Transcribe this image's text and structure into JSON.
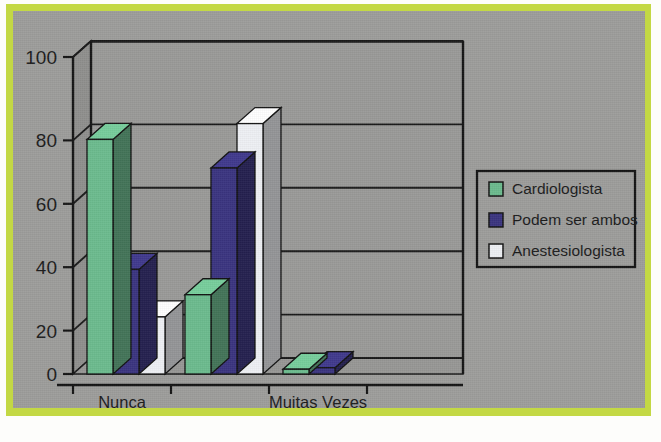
{
  "figure": {
    "border_color": "#c3d844",
    "plate_color": "#9d9d9b"
  },
  "chart_data": {
    "type": "bar",
    "title": "",
    "subtitle": "",
    "xlabel": "",
    "ylabel": "",
    "categories": [
      "Nunca",
      "",
      "Muitas Vezes",
      ""
    ],
    "visible_category_labels": [
      "Nunca",
      "Muitas Vezes"
    ],
    "series": [
      {
        "name": "Cardiologista",
        "color": "#6cbb8e",
        "values": [
          74,
          25,
          1.5,
          0
        ]
      },
      {
        "name": "Podem ser ambos",
        "color": "#3a3480",
        "values": [
          33,
          65,
          2,
          0
        ]
      },
      {
        "name": "Anestesiologista",
        "color": "#eef0f4",
        "values": [
          18,
          79,
          0,
          0
        ]
      }
    ],
    "ylim": [
      0,
      100
    ],
    "yticks": [
      0,
      20,
      40,
      60,
      80,
      100
    ],
    "ytick_labels": [
      "0",
      "20",
      "40",
      "60",
      "80",
      "100"
    ],
    "grid": true,
    "grid_axis": "y",
    "legend_position": "right",
    "style": "3d-bar"
  },
  "legend": {
    "entries": [
      {
        "label": "Cardiologista",
        "swatch": "#6cbb8e"
      },
      {
        "label": "Podem ser ambos",
        "swatch": "#3a3480"
      },
      {
        "label": "Anestesiologista",
        "swatch": "#eef0f4"
      }
    ]
  },
  "axis": {
    "y_labels": [
      "100",
      "80",
      "60",
      "40",
      "20",
      "0"
    ],
    "x_labels": [
      "Nunca",
      "Muitas Vezes"
    ]
  }
}
